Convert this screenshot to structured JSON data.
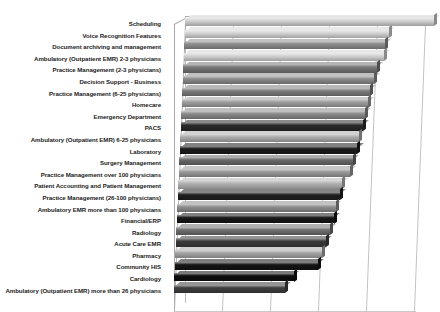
{
  "chart_data": {
    "type": "bar",
    "orientation": "horizontal",
    "title": "",
    "subtitle": "",
    "xlabel": "",
    "ylabel": "",
    "grid": true,
    "legend": false,
    "legend_position": "none",
    "xlim": [
      0,
      5
    ],
    "xticks": [
      0,
      1,
      2,
      3,
      4,
      5
    ],
    "xtick_labels": [
      "",
      "",
      "",
      "",
      "",
      ""
    ],
    "categories": [
      "Scheduling",
      "Voice Recognition Features",
      "Document archiving and management",
      "Ambulatory (Outpatient EMR) 2-3 physicians",
      "Practice Management (2-3 physicians)",
      "Decision Support - Business",
      "Practice Management (6-25 physicians)",
      "Homecare",
      "Emergency Department",
      "PACS",
      "Ambulatory (Outpatient EMR) 6-25 physicians",
      "Laboratory",
      "Surgery Management",
      "Practice Management over 100 physicians",
      "Patient Accounting and Patient Management",
      "Practice Management (26-100 physicians)",
      "Ambulatory EMR more than 100 physicians",
      "Financial/ERP",
      "Radiology",
      "Acute Care EMR",
      "Pharmacy",
      "Community HIS",
      "Cardiology",
      "Ambulatory (Outpatient EMR) more than 26 physicians"
    ],
    "values": [
      5.18,
      4.25,
      4.18,
      4.17,
      4.05,
      3.98,
      3.92,
      3.88,
      3.84,
      3.8,
      3.73,
      3.7,
      3.62,
      3.57,
      3.42,
      3.38,
      3.3,
      3.27,
      3.2,
      3.12,
      3.05,
      2.98,
      2.48,
      2.32
    ],
    "bar_colors": [
      "#d2d2d2",
      "#d6d6d6",
      "#8e8e8e",
      "#d4d4d4",
      "#777777",
      "#8c8c8c",
      "#7d7d7d",
      "#a0a0a0",
      "#8a8a8a",
      "#2a2a2a",
      "#aeaeae",
      "#1c1c1c",
      "#6a6a6a",
      "#9a9a9a",
      "#b5b5b5",
      "#202020",
      "#8f8f8f",
      "#161616",
      "#6f6f6f",
      "#3a3a3a",
      "#a6a6a6",
      "#141414",
      "#0f0f0f",
      "#3f3f3f"
    ]
  },
  "axis": {
    "gridline_color": "#c2c2c2",
    "frame_color": "#b0b0b0",
    "label_color": "#1b1b1b"
  }
}
